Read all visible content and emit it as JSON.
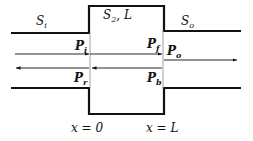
{
  "diagram": {
    "regions": {
      "inlet": {
        "symbol": "S",
        "sub": "i"
      },
      "chamber": {
        "symbol": "S",
        "sub": "2",
        "suffix": ", L"
      },
      "outlet": {
        "symbol": "S",
        "sub": "o"
      }
    },
    "powers": {
      "incident": {
        "symbol": "P",
        "sub": "i"
      },
      "reflected": {
        "symbol": "P",
        "sub": "r"
      },
      "forward": {
        "symbol": "P",
        "sub": "f"
      },
      "backward": {
        "symbol": "P",
        "sub": "b"
      },
      "outgoing": {
        "symbol": "P",
        "sub": "o"
      }
    },
    "positions": {
      "left": "x = 0",
      "right": "x = L"
    },
    "colors": {
      "line": "#111111",
      "background": "#ffffff"
    }
  }
}
